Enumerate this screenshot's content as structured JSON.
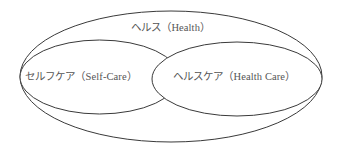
{
  "diagram": {
    "type": "nested-venn",
    "colors": {
      "stroke": "#3a3a3a",
      "text": "#555555",
      "background": "#ffffff"
    },
    "sets": {
      "health": {
        "label": "ヘルス（Health）",
        "role": "outer container"
      },
      "self_care": {
        "label": "セルフケア（Self-Care）",
        "role": "inner left, overlaps health care"
      },
      "health_care": {
        "label": "ヘルスケア（Health Care）",
        "role": "inner right, overlaps self-care"
      }
    },
    "relations": [
      {
        "from": "self_care",
        "to": "health",
        "type": "contained-in"
      },
      {
        "from": "health_care",
        "to": "health",
        "type": "contained-in"
      },
      {
        "from": "self_care",
        "to": "health_care",
        "type": "overlaps"
      }
    ]
  }
}
